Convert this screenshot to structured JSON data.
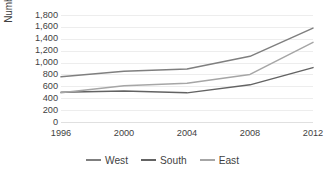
{
  "chart_data": {
    "type": "line",
    "title": "",
    "subtitle": "",
    "xlabel": "",
    "ylabel": "Number of firms",
    "x": [
      1996,
      2000,
      2004,
      2008,
      2012
    ],
    "categories": [
      "1996",
      "2000",
      "2004",
      "2008",
      "2012"
    ],
    "series": [
      {
        "name": "West",
        "values": [
          760,
          855,
          890,
          1105,
          1580
        ],
        "color": "#7f7f7f"
      },
      {
        "name": "South",
        "values": [
          500,
          520,
          490,
          625,
          915
        ],
        "color": "#636363"
      },
      {
        "name": "East",
        "values": [
          490,
          610,
          650,
          800,
          1340
        ],
        "color": "#a6a6a6"
      }
    ],
    "ylim": [
      0,
      1800
    ],
    "ytick_values": [
      0,
      200,
      400,
      600,
      800,
      1000,
      1200,
      1400,
      1600,
      1800
    ],
    "ytick_labels": [
      "0",
      "200",
      "400",
      "600",
      "800",
      "1,000",
      "1,200",
      "1,400",
      "1,600",
      "1,800"
    ],
    "grid": true,
    "grid_axis": "y",
    "legend_position": "bottom",
    "markers": false,
    "background_color": "#ffffff",
    "grid_color": "#ededed",
    "text_color": "#3f3f3f"
  },
  "legend": {
    "items": [
      {
        "label": "West"
      },
      {
        "label": "South"
      },
      {
        "label": "East"
      }
    ]
  }
}
